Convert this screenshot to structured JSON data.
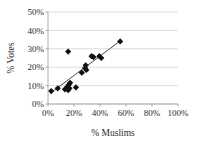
{
  "chart_data": {
    "type": "scatter",
    "title": "",
    "xlabel": "% Muslims",
    "ylabel": "% Votes",
    "xlim": [
      0,
      100
    ],
    "ylim": [
      0,
      50
    ],
    "xticks": [
      "0%",
      "20%",
      "40%",
      "60%",
      "80%",
      "100%"
    ],
    "xtick_values": [
      0,
      20,
      40,
      60,
      80,
      100
    ],
    "yticks": [
      "0%",
      "10%",
      "20%",
      "30%",
      "40%",
      "50%"
    ],
    "ytick_values": [
      0,
      10,
      20,
      30,
      40,
      50
    ],
    "grid": "horizontal",
    "legend": "none",
    "marker": "diamond",
    "marker_color": "#111111",
    "series": [
      {
        "name": "Constituencies",
        "points": [
          {
            "x": 2.5,
            "y": 7.0
          },
          {
            "x": 7.5,
            "y": 8.5
          },
          {
            "x": 13.0,
            "y": 8.0
          },
          {
            "x": 15.0,
            "y": 9.5
          },
          {
            "x": 15.5,
            "y": 7.5
          },
          {
            "x": 16.0,
            "y": 10.5
          },
          {
            "x": 16.5,
            "y": 8.5
          },
          {
            "x": 17.0,
            "y": 11.5
          },
          {
            "x": 15.5,
            "y": 28.5
          },
          {
            "x": 21.5,
            "y": 9.0
          },
          {
            "x": 26.0,
            "y": 17.0
          },
          {
            "x": 28.5,
            "y": 19.5
          },
          {
            "x": 29.0,
            "y": 21.0
          },
          {
            "x": 29.5,
            "y": 18.5
          },
          {
            "x": 33.5,
            "y": 26.0
          },
          {
            "x": 35.0,
            "y": 25.5
          },
          {
            "x": 39.5,
            "y": 26.0
          },
          {
            "x": 41.0,
            "y": 25.0
          },
          {
            "x": 55.5,
            "y": 34.0
          }
        ]
      }
    ],
    "trendline": {
      "type": "linear",
      "x_start": 2.0,
      "y_start": 6.0,
      "x_end": 56.0,
      "y_end": 34.5
    }
  }
}
